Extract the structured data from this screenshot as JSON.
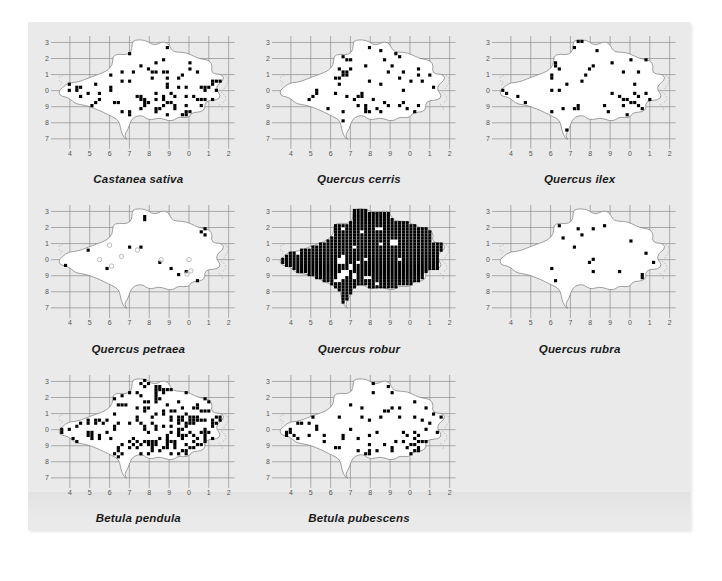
{
  "figure": {
    "background_color": "#eaeaea",
    "page_color": "#ffffff",
    "grid_color": "#8d8d8d",
    "dot_color": "#000000",
    "open_dot_color": "#b4b4b4",
    "coast_color": "#7a7a7a"
  },
  "axes": {
    "x_ticks": [
      "4",
      "5",
      "6",
      "7",
      "8",
      "9",
      "0",
      "1",
      "2"
    ],
    "y_ticks": [
      "3",
      "2",
      "1",
      "0",
      "9",
      "8",
      "7"
    ],
    "xlabel": "",
    "ylabel": "",
    "grid": "on"
  },
  "chart_data": {
    "type": "scatter",
    "title": "",
    "subtitle": "",
    "xlabel": "",
    "ylabel": "",
    "grid": "on",
    "legend": "none",
    "x": [
      "4",
      "5",
      "6",
      "7",
      "8",
      "9",
      "0",
      "1",
      "2"
    ],
    "categories": [
      "4",
      "5",
      "6",
      "7",
      "8",
      "9",
      "0",
      "1",
      "2"
    ],
    "xlim": [
      3.4,
      12.3
    ],
    "ylim": [
      6.6,
      13.4
    ],
    "x_tick_labels": [
      "4",
      "5",
      "6",
      "7",
      "8",
      "9",
      "0",
      "1",
      "2"
    ],
    "y_tick_labels": [
      "3",
      "2",
      "1",
      "0",
      "9",
      "8",
      "7"
    ],
    "panel_layout": {
      "rows": 3,
      "cols": 3,
      "empty_cells": [
        8
      ]
    },
    "series": [
      {
        "name": "Castanea sativa",
        "panel": 0,
        "marker": "filled-square",
        "n_records": 310,
        "density": 0.34,
        "seed": 11,
        "hotspots": [
          {
            "cx": 9.1,
            "cy": 9.0,
            "rx": 2.4,
            "ry": 0.62,
            "w": 3.3
          },
          {
            "cx": 4.3,
            "cy": 9.7,
            "rx": 0.95,
            "ry": 0.85,
            "w": 2.3
          },
          {
            "cx": 10.6,
            "cy": 10.0,
            "rx": 0.9,
            "ry": 1.0,
            "w": 2.2
          },
          {
            "cx": 8.2,
            "cy": 11.4,
            "rx": 1.7,
            "ry": 1.0,
            "w": 1.0
          }
        ]
      },
      {
        "name": "Quercus cerris",
        "panel": 1,
        "marker": "filled-square",
        "n_records": 205,
        "density": 0.22,
        "seed": 23,
        "hotspots": [
          {
            "cx": 8.6,
            "cy": 9.1,
            "rx": 1.8,
            "ry": 0.6,
            "w": 3.0
          },
          {
            "cx": 6.5,
            "cy": 11.4,
            "rx": 0.75,
            "ry": 0.85,
            "w": 1.8
          },
          {
            "cx": 10.2,
            "cy": 9.6,
            "rx": 0.9,
            "ry": 0.8,
            "w": 1.6
          },
          {
            "cx": 4.2,
            "cy": 9.7,
            "rx": 0.7,
            "ry": 0.55,
            "w": 1.5
          }
        ]
      },
      {
        "name": "Quercus ilex",
        "panel": 2,
        "marker": "filled-square",
        "n_records": 215,
        "density": 0.23,
        "seed": 37,
        "hotspots": [
          {
            "cx": 10.5,
            "cy": 9.4,
            "rx": 1.0,
            "ry": 0.85,
            "w": 3.2
          },
          {
            "cx": 6.9,
            "cy": 8.4,
            "rx": 0.75,
            "ry": 0.8,
            "w": 2.4
          },
          {
            "cx": 4.3,
            "cy": 9.6,
            "rx": 0.95,
            "ry": 0.45,
            "w": 2.0
          },
          {
            "cx": 9.2,
            "cy": 8.6,
            "rx": 1.2,
            "ry": 0.45,
            "w": 1.4
          }
        ]
      },
      {
        "name": "Quercus petraea",
        "panel": 3,
        "marker": "filled-square",
        "n_records": 78,
        "density": 0.085,
        "seed": 53,
        "hotspots": [
          {
            "cx": 4.15,
            "cy": 9.9,
            "rx": 0.65,
            "ry": 0.55,
            "w": 4.5
          },
          {
            "cx": 10.8,
            "cy": 11.2,
            "rx": 0.75,
            "ry": 0.55,
            "w": 2.6
          },
          {
            "cx": 10.2,
            "cy": 9.2,
            "rx": 0.85,
            "ry": 0.75,
            "w": 2.2
          }
        ],
        "open_markers": [
          [
            6.0,
            10.9
          ],
          [
            5.5,
            10.0
          ],
          [
            6.1,
            9.6
          ],
          [
            7.4,
            10.6
          ],
          [
            8.6,
            10.0
          ],
          [
            10.0,
            10.0
          ],
          [
            10.1,
            9.3
          ],
          [
            9.9,
            9.1
          ],
          [
            6.6,
            10.2
          ]
        ]
      },
      {
        "name": "Quercus robur",
        "panel": 4,
        "marker": "filled-square",
        "n_records": 1050,
        "density": 0.99,
        "seed": 67,
        "saturated": true,
        "gaps": [
          [
            8.4,
            11.9
          ],
          [
            9.2,
            11.1
          ],
          [
            9.25,
            11.05
          ],
          [
            6.6,
            9.9
          ],
          [
            7.0,
            9.5
          ],
          [
            6.7,
            9.3
          ],
          [
            6.8,
            9.2
          ],
          [
            6.5,
            9.0
          ],
          [
            7.2,
            9.0
          ],
          [
            7.9,
            8.9
          ],
          [
            6.4,
            8.7
          ]
        ]
      },
      {
        "name": "Quercus rubra",
        "panel": 5,
        "marker": "filled-square",
        "n_records": 92,
        "density": 0.1,
        "seed": 83,
        "hotspots": [
          {
            "cx": 10.4,
            "cy": 9.7,
            "rx": 0.85,
            "ry": 0.7,
            "w": 3.4
          },
          {
            "cx": 8.3,
            "cy": 9.4,
            "rx": 0.55,
            "ry": 0.45,
            "w": 2.2
          }
        ]
      },
      {
        "name": "Betula pendula",
        "panel": 6,
        "marker": "filled-square",
        "n_records": 620,
        "density": 0.64,
        "seed": 97,
        "hotspots": [
          {
            "cx": 9.6,
            "cy": 9.1,
            "rx": 2.2,
            "ry": 0.85,
            "w": 2.2
          },
          {
            "cx": 4.5,
            "cy": 9.9,
            "rx": 1.1,
            "ry": 0.75,
            "w": 2.0
          },
          {
            "cx": 10.6,
            "cy": 10.4,
            "rx": 1.1,
            "ry": 1.1,
            "w": 1.6
          },
          {
            "cx": 7.9,
            "cy": 11.6,
            "rx": 1.3,
            "ry": 1.1,
            "w": 1.3
          }
        ]
      },
      {
        "name": "Betula pubescens",
        "panel": 7,
        "marker": "filled-square",
        "n_records": 390,
        "density": 0.4,
        "seed": 113,
        "hotspots": [
          {
            "cx": 9.4,
            "cy": 9.1,
            "rx": 1.9,
            "ry": 0.7,
            "w": 3.3
          },
          {
            "cx": 10.9,
            "cy": 10.6,
            "rx": 0.7,
            "ry": 0.85,
            "w": 3.4
          },
          {
            "cx": 4.1,
            "cy": 9.8,
            "rx": 0.75,
            "ry": 0.7,
            "w": 2.8
          },
          {
            "cx": 10.3,
            "cy": 8.7,
            "rx": 0.55,
            "ry": 0.65,
            "w": 2.2
          }
        ]
      }
    ]
  },
  "panels": [
    {
      "id": "panel-castanea-sativa",
      "caption": "Castanea sativa"
    },
    {
      "id": "panel-quercus-cerris",
      "caption": "Quercus cerris"
    },
    {
      "id": "panel-quercus-ilex",
      "caption": "Quercus ilex"
    },
    {
      "id": "panel-quercus-petraea",
      "caption": "Quercus petraea"
    },
    {
      "id": "panel-quercus-robur",
      "caption": "Quercus robur"
    },
    {
      "id": "panel-quercus-rubra",
      "caption": "Quercus rubra"
    },
    {
      "id": "panel-betula-pendula",
      "caption": "Betula pendula"
    },
    {
      "id": "panel-betula-pubescens",
      "caption": "Betula pubescens"
    }
  ]
}
